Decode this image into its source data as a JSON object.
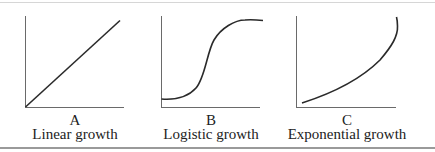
{
  "figure": {
    "panels": [
      {
        "letter": "A",
        "caption": "Linear growth",
        "curve": "linear"
      },
      {
        "letter": "B",
        "caption": "Logistic growth",
        "curve": "logistic"
      },
      {
        "letter": "C",
        "caption": "Exponential growth",
        "curve": "exponential"
      }
    ],
    "colors": {
      "line": "#2a2a2a",
      "axis": "#6a6a6a",
      "rule_bottom": "#9a9a9a",
      "rule_top": "#d6d6d6"
    }
  }
}
